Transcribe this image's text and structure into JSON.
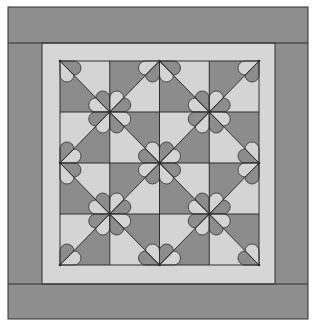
{
  "figure": {
    "title": "Quilt pattern diagram"
  },
  "colors": {
    "background": "#ffffff",
    "outer_border": "#8e8e8e",
    "inner_border": "#d6d6d6",
    "dark_fabric": "#8c8c8c",
    "light_fabric": "#d4d4d4",
    "line": "#2e2e2e"
  },
  "layout": {
    "outer": {
      "x": 8,
      "y": 7,
      "w": 300,
      "h": 312
    },
    "inner_border": {
      "x": 42,
      "y": 43,
      "w": 233,
      "h": 241
    },
    "center": {
      "x": 60,
      "y": 61,
      "w": 199,
      "h": 204
    },
    "grid": {
      "cols": 4,
      "rows": 4
    },
    "petal_radius": 7
  },
  "block": {
    "description": "2x2 repeat unit; each cell split by diagonal into light and dark triangles",
    "cells": [
      {
        "pos": "top-left",
        "diagonal": "backslash",
        "upper": "light",
        "lower": "dark"
      },
      {
        "pos": "top-right",
        "diagonal": "slash",
        "upper": "dark",
        "lower": "light"
      },
      {
        "pos": "bottom-left",
        "diagonal": "slash",
        "upper": "light",
        "lower": "dark"
      },
      {
        "pos": "bottom-right",
        "diagonal": "backslash",
        "upper": "dark",
        "lower": "light"
      }
    ]
  },
  "flowers": {
    "full": [
      [
        1,
        1
      ],
      [
        3,
        1
      ],
      [
        2,
        2
      ],
      [
        1,
        3
      ],
      [
        3,
        3
      ]
    ],
    "partial": [
      [
        0,
        0
      ],
      [
        2,
        0
      ],
      [
        4,
        0
      ],
      [
        0,
        2
      ],
      [
        4,
        2
      ],
      [
        0,
        4
      ],
      [
        2,
        4
      ],
      [
        4,
        4
      ]
    ]
  }
}
